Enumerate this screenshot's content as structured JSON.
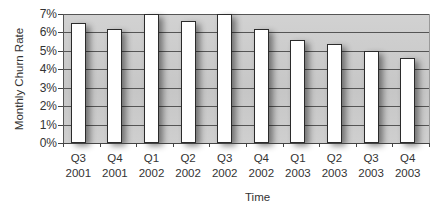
{
  "chart_data": {
    "type": "bar",
    "title": "",
    "xlabel": "Time",
    "ylabel": "Monthly Churn Rate",
    "categories": [
      "Q3 2001",
      "Q4 2001",
      "Q1 2002",
      "Q2 2002",
      "Q3 2002",
      "Q4 2002",
      "Q1 2003",
      "Q2 2003",
      "Q3 2003",
      "Q4 2003"
    ],
    "category_lines": [
      [
        "Q3",
        "2001"
      ],
      [
        "Q4",
        "2001"
      ],
      [
        "Q1",
        "2002"
      ],
      [
        "Q2",
        "2002"
      ],
      [
        "Q3",
        "2002"
      ],
      [
        "Q4",
        "2002"
      ],
      [
        "Q1",
        "2003"
      ],
      [
        "Q2",
        "2003"
      ],
      [
        "Q3",
        "2003"
      ],
      [
        "Q4",
        "2003"
      ]
    ],
    "values": [
      6.5,
      6.2,
      7.0,
      6.6,
      7.0,
      6.2,
      5.6,
      5.4,
      5.0,
      4.6
    ],
    "unit": "%",
    "ylim": [
      0,
      7
    ],
    "yticks": [
      "0%",
      "1%",
      "2%",
      "3%",
      "4%",
      "5%",
      "6%",
      "7%"
    ],
    "grid": true,
    "legend": null,
    "colors": {
      "bar_fill": "#ffffff",
      "bar_edge": "#2b2b2b",
      "plot_bg": "#cccccc",
      "grid": "#555555"
    }
  }
}
